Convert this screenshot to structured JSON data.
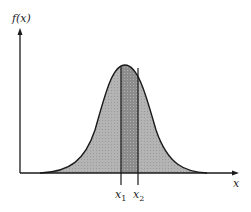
{
  "figure": {
    "y_axis_label": "f(x)",
    "x_axis_label": "x",
    "markers": [
      {
        "label": "x",
        "sub": "1"
      },
      {
        "label": "x",
        "sub": "2"
      }
    ],
    "colors": {
      "curve_fill": "#b8b8b8",
      "interval_fill": "#8e8e8e",
      "line": "#1a1a1a",
      "background": "#ffffff"
    }
  }
}
